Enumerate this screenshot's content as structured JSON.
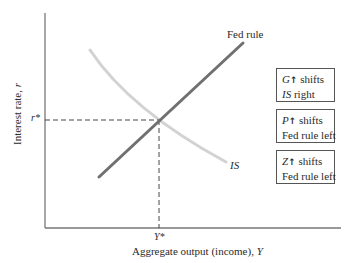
{
  "diagram": {
    "type": "IS-Fed rule (IS-MP) diagram",
    "y_axis_label": "Interest rate, ",
    "y_axis_var": "r",
    "x_axis_label": "Aggregate output (income), ",
    "x_axis_var": "Y",
    "equilibrium_r": "r*",
    "equilibrium_y": "Y*",
    "curves": [
      {
        "name": "Fed rule",
        "label": "Fed rule",
        "slope": "upward",
        "color": "#6e6e6e"
      },
      {
        "name": "IS",
        "label": "IS",
        "slope": "downward",
        "color": "#cfcfcf"
      }
    ],
    "boxes": [
      {
        "var": "G",
        "arrow": "↑",
        "line1_rest": " shifts",
        "line2_var": "IS",
        "line2_rest": " right"
      },
      {
        "var": "P",
        "arrow": "↑",
        "line1_rest": " shifts",
        "line2_var": "",
        "line2_rest": "Fed rule left"
      },
      {
        "var": "Z",
        "arrow": "↑",
        "line1_rest": " shifts",
        "line2_var": "",
        "line2_rest": "Fed rule left"
      }
    ]
  }
}
